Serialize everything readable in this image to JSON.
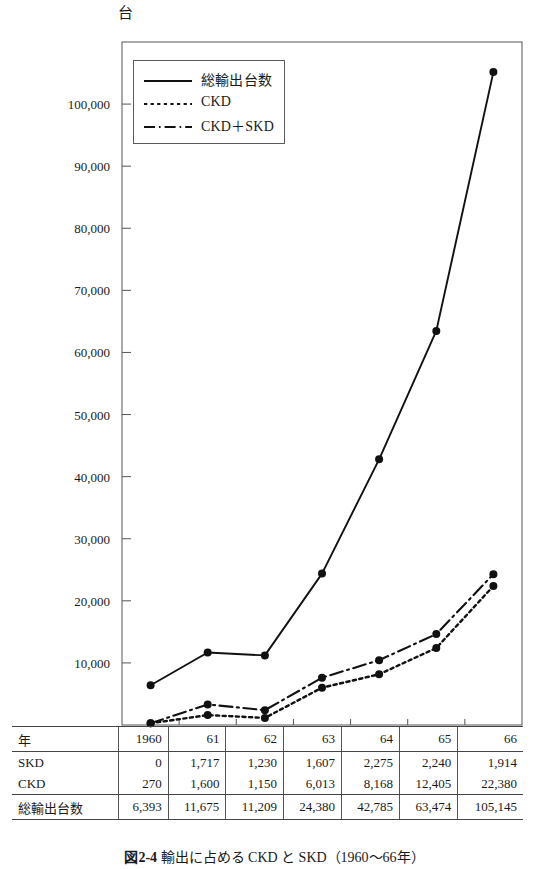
{
  "figure": {
    "unit_label": "台",
    "caption_number": "図2-4",
    "caption_text": "輸出に占める CKD と SKD（1960～66年）"
  },
  "legend": {
    "items": [
      {
        "label": "総輸出台数",
        "style": "solid"
      },
      {
        "label": "CKD",
        "style": "dotted"
      },
      {
        "label": "CKD＋SKD",
        "style": "dashdot"
      }
    ]
  },
  "table": {
    "row_headers": [
      "年",
      "SKD",
      "CKD",
      "総輸出台数"
    ],
    "years": [
      "1960",
      "61",
      "62",
      "63",
      "64",
      "65",
      "66"
    ],
    "skd": [
      "0",
      "1,717",
      "1,230",
      "1,607",
      "2,275",
      "2,240",
      "1,914"
    ],
    "ckd": [
      "270",
      "1,600",
      "1,150",
      "6,013",
      "8,168",
      "12,405",
      "22,380"
    ],
    "total": [
      "6,393",
      "11,675",
      "11,209",
      "24,380",
      "42,785",
      "63,474",
      "105,145"
    ]
  },
  "chart_data": {
    "type": "line",
    "title": "",
    "xlabel": "年",
    "ylabel": "台",
    "categories": [
      "1960",
      "61",
      "62",
      "63",
      "64",
      "65",
      "66"
    ],
    "x": [
      1960,
      1961,
      1962,
      1963,
      1964,
      1965,
      1966
    ],
    "ylim": [
      0,
      110000
    ],
    "yticks": [
      10000,
      20000,
      30000,
      40000,
      50000,
      60000,
      70000,
      80000,
      90000,
      100000
    ],
    "ytick_labels": [
      "10,000",
      "20,000",
      "30,000",
      "40,000",
      "50,000",
      "60,000",
      "70,000",
      "80,000",
      "90,000",
      "100,000"
    ],
    "grid": false,
    "legend_position": "upper-left-inside",
    "series": [
      {
        "name": "総輸出台数",
        "style": "solid",
        "values": [
          6393,
          11675,
          11209,
          24380,
          42785,
          63474,
          105145
        ]
      },
      {
        "name": "CKD",
        "style": "dotted",
        "values": [
          270,
          1600,
          1150,
          6013,
          8168,
          12405,
          22380
        ]
      },
      {
        "name": "CKD＋SKD",
        "style": "dashdot",
        "values": [
          270,
          3317,
          2380,
          7620,
          10443,
          14645,
          24294
        ]
      }
    ]
  },
  "colors": {
    "line": "#111111",
    "frame": "#555555",
    "text": "#1a1a1a"
  }
}
